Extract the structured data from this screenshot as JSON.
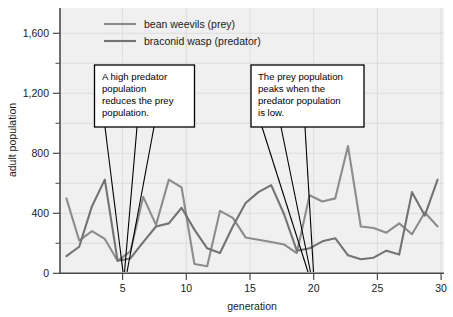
{
  "chart_data": {
    "type": "line",
    "title": "",
    "xlabel": "generation",
    "ylabel": "adult population",
    "xlim": [
      0.5,
      30.5
    ],
    "ylim": [
      0,
      1700
    ],
    "grid": true,
    "legend_position": "top-center",
    "x_ticks": [
      5,
      10,
      15,
      20,
      25,
      30
    ],
    "x_tick_labels": [
      "5",
      "10",
      "15",
      "20",
      "25",
      "30"
    ],
    "y_ticks": [
      0,
      400,
      800,
      1200,
      1600
    ],
    "y_tick_labels": [
      "0",
      "400",
      "800",
      "1,200",
      "1,600"
    ],
    "y_minor_ticks": [
      200,
      600,
      1000,
      1400
    ],
    "x": [
      1,
      2,
      3,
      4,
      5,
      6,
      7,
      8,
      9,
      10,
      11,
      12,
      13,
      14,
      15,
      16,
      17,
      18,
      19,
      20,
      21,
      22,
      23,
      24,
      25,
      26,
      27,
      28,
      29,
      30
    ],
    "series": [
      {
        "name": "bean weevils (prey)",
        "color": "#8c8c8c",
        "values": [
          480,
          210,
          270,
          220,
          80,
          140,
          490,
          310,
          600,
          550,
          60,
          45,
          400,
          355,
          230,
          215,
          200,
          185,
          130,
          500,
          460,
          480,
          815,
          300,
          290,
          260,
          320,
          250,
          390,
          300
        ]
      },
      {
        "name": "braconid wasp (predator)",
        "color": "#737373",
        "values": [
          110,
          170,
          430,
          600,
          80,
          95,
          200,
          300,
          320,
          420,
          280,
          160,
          130,
          300,
          450,
          520,
          565,
          380,
          145,
          160,
          205,
          225,
          115,
          90,
          100,
          145,
          120,
          520,
          370,
          600
        ]
      }
    ],
    "annotations": [
      {
        "id": "annotation-predator-reduces-prey",
        "lines": [
          "A high predator",
          "population",
          "reduces the prey",
          "population."
        ]
      },
      {
        "id": "annotation-prey-peaks",
        "lines": [
          "The prey population",
          "peaks when the",
          "predator population",
          "is low."
        ]
      }
    ]
  },
  "legend": {
    "items": [
      {
        "label": "bean weevils (prey)"
      },
      {
        "label": "braconid wasp (predator)"
      }
    ]
  },
  "axes": {
    "x_title": "generation",
    "y_title": "adult population"
  }
}
